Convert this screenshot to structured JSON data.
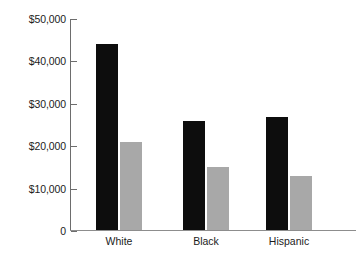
{
  "chart_data": {
    "type": "bar",
    "title": "",
    "xlabel": "",
    "ylabel": "",
    "categories": [
      "White",
      "Black",
      "Hispanic"
    ],
    "series": [
      {
        "name": "series-1",
        "color": "#0d0d0d",
        "values": [
          44000,
          26000,
          27000
        ]
      },
      {
        "name": "series-2",
        "color": "#a8a8a8",
        "values": [
          21000,
          15000,
          13000
        ]
      }
    ],
    "ylim": [
      0,
      50000
    ],
    "yticks": [
      0,
      10000,
      20000,
      30000,
      40000,
      50000
    ],
    "ytick_labels": [
      "0",
      "$10,000",
      "$20,000",
      "$30,000",
      "$40,000",
      "$50,000"
    ],
    "grid": false,
    "legend": "none"
  },
  "axis": {
    "y_labels": [
      {
        "value": 50000,
        "text": "$50,000"
      },
      {
        "value": 40000,
        "text": "$40,000"
      },
      {
        "value": 30000,
        "text": "$30,000"
      },
      {
        "value": 20000,
        "text": "$20,000"
      },
      {
        "value": 10000,
        "text": "$10,000"
      },
      {
        "value": 0,
        "text": "0"
      }
    ]
  },
  "colors": {
    "bar_primary": "#0d0d0d",
    "bar_secondary": "#a8a8a8",
    "axis": "#6d6d6d",
    "baseline": "#8d8d8d",
    "background": "#ffffff",
    "text": "#1c1c1c"
  }
}
